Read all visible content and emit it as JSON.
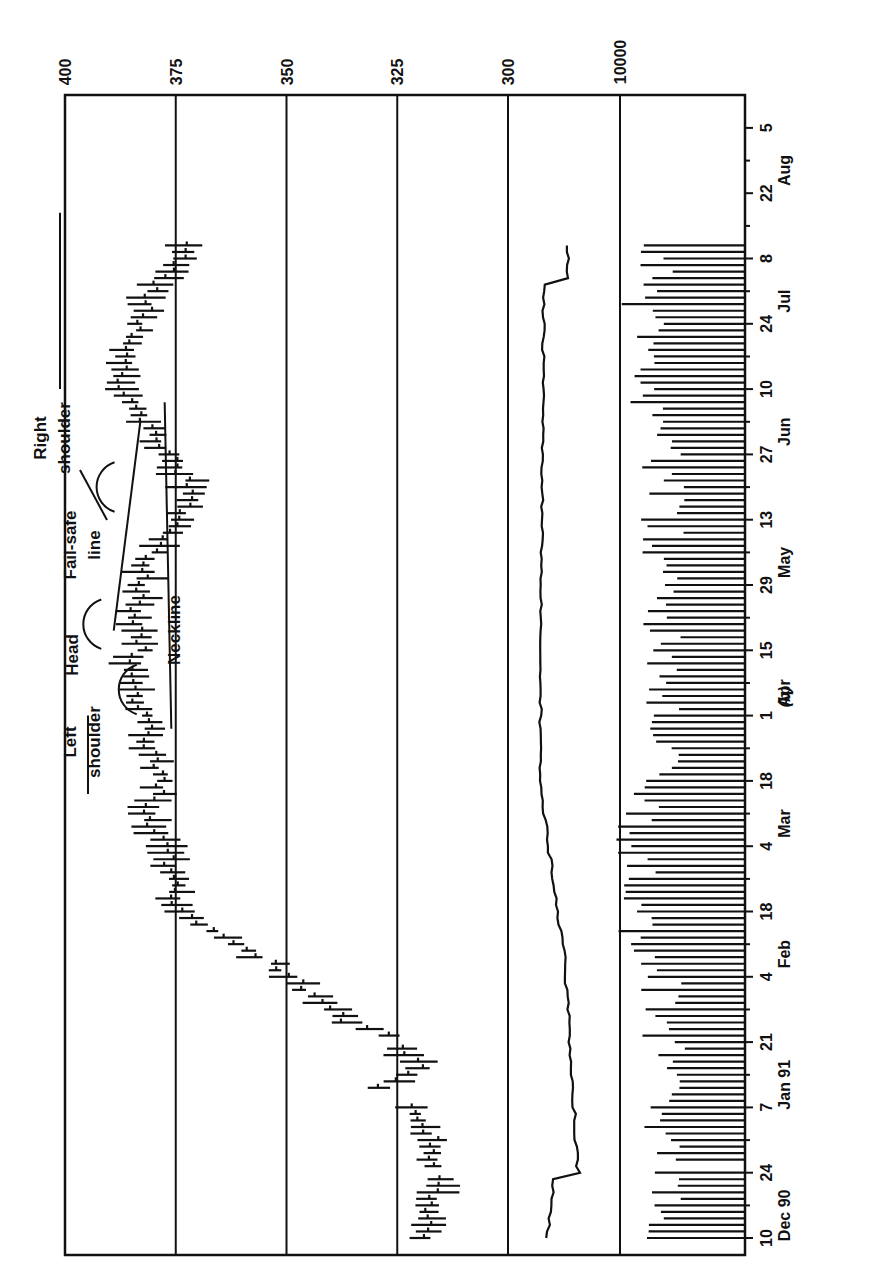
{
  "chart_data": {
    "type": "bar",
    "subtype": "ohlc-price-with-volume-and-indicator-line",
    "orientation_note": "figure printed rotated 90 degrees counter-clockwise",
    "caption": "(b)",
    "price_axis": {
      "ticks": [
        400,
        375,
        350,
        325,
        300
      ],
      "range": [
        300,
        400
      ],
      "gridlines": [
        375,
        350,
        325,
        300
      ]
    },
    "volume_axis": {
      "ticks": [
        10000
      ]
    },
    "x_axis": {
      "ticks": [
        "10",
        "24",
        "7",
        "21",
        "4",
        "18",
        "4",
        "18",
        "1",
        "15",
        "29",
        "13",
        "27",
        "10",
        "24",
        "8",
        "22",
        "5"
      ],
      "month_labels": [
        {
          "label": "Dec 90",
          "at_tick": 0.5
        },
        {
          "label": "Jan 91",
          "at_tick": 2.5
        },
        {
          "label": "Feb",
          "at_tick": 4.5
        },
        {
          "label": "Mar",
          "at_tick": 6.5
        },
        {
          "label": "Apr",
          "at_tick": 8.5
        },
        {
          "label": "May",
          "at_tick": 10.5
        },
        {
          "label": "Jun",
          "at_tick": 12.5
        },
        {
          "label": "Jul",
          "at_tick": 14.5
        },
        {
          "label": "Aug",
          "at_tick": 16.5
        }
      ]
    },
    "annotations": [
      {
        "label": "Left shoulder",
        "text_lines": [
          "Left",
          "shoulder"
        ]
      },
      {
        "label": "Head",
        "text_lines": [
          "Head"
        ]
      },
      {
        "label": "Fail-safe line",
        "text_lines": [
          "Fail-safe",
          "line"
        ]
      },
      {
        "label": "Right shoulder",
        "text_lines": [
          "Right",
          "shoulder"
        ]
      },
      {
        "label": "Neckline",
        "text_lines": [
          "Neckline"
        ]
      }
    ],
    "price_series_approx": {
      "note": "weekly-spaced approximate closes read from bar chart (price units)",
      "x_tick_index": [
        0,
        0.5,
        1,
        1.5,
        2,
        2.3,
        2.6,
        3,
        3.3,
        3.6,
        4,
        4.3,
        4.6,
        5,
        5.5,
        6,
        6.5,
        7,
        7.5,
        8,
        8.5,
        9,
        9.5,
        10,
        10.5,
        11,
        11.5,
        12,
        12.5,
        13,
        13.5,
        14,
        14.5,
        15
      ],
      "values": [
        319,
        318,
        316,
        317,
        322,
        328,
        320,
        324,
        337,
        342,
        349,
        356,
        365,
        375,
        376,
        377,
        382,
        377,
        381,
        382,
        386,
        383,
        384,
        383,
        380,
        374,
        372,
        376,
        383,
        388,
        386,
        383,
        380,
        374
      ]
    },
    "indicator_line": {
      "note": "smooth line in middle panel (between 300 and 10000 gridlines), with two step jumps near Dec 24 and Mar 18",
      "jumps_at_tick": [
        1.0,
        7.0,
        14.7
      ]
    },
    "volume_bars": {
      "note": "daily volume bars rising from baseline, peaks near Feb-Mar and Jun"
    }
  },
  "labels": {
    "caption": "(b)",
    "price_ticks": [
      "400",
      "375",
      "350",
      "325",
      "300"
    ],
    "volume_tick": "10000",
    "left_shoulder_1": "Left",
    "left_shoulder_2": "shoulder",
    "head": "Head",
    "failsafe_1": "Fail-safe",
    "failsafe_2": "line",
    "right_shoulder_1": "Right",
    "right_shoulder_2": "shoulder",
    "neckline": "Neckline"
  }
}
